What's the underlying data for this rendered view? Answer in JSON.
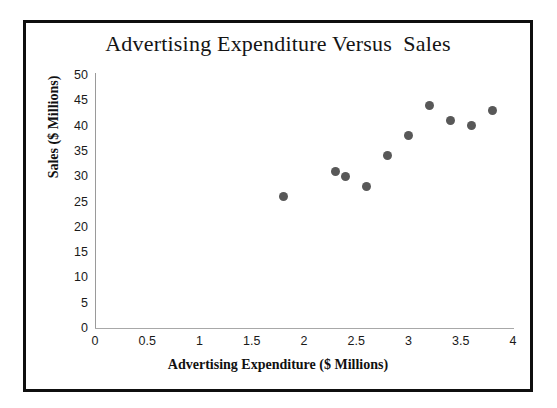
{
  "chart_data": {
    "type": "scatter",
    "title": "Advertising Expenditure Versus  Sales",
    "xlabel": "Advertising Expenditure ($ Millions)",
    "ylabel": "Sales ($ Millions)",
    "xlim": [
      0,
      4
    ],
    "ylim": [
      0,
      50
    ],
    "xticks": [
      "0",
      "0.5",
      "1",
      "1.5",
      "2",
      "2.5",
      "3",
      "3.5",
      "4"
    ],
    "xtick_values": [
      0,
      0.5,
      1,
      1.5,
      2,
      2.5,
      3,
      3.5,
      4
    ],
    "yticks": [
      "0",
      "5",
      "10",
      "15",
      "20",
      "25",
      "30",
      "35",
      "40",
      "45",
      "50"
    ],
    "ytick_values": [
      0,
      5,
      10,
      15,
      20,
      25,
      30,
      35,
      40,
      45,
      50
    ],
    "grid": false,
    "legend": false,
    "marker_color": "#585858",
    "series": [
      {
        "name": "Advertising vs Sales",
        "points": [
          {
            "x": 1.8,
            "y": 26
          },
          {
            "x": 2.3,
            "y": 31
          },
          {
            "x": 2.4,
            "y": 30
          },
          {
            "x": 2.6,
            "y": 28
          },
          {
            "x": 2.8,
            "y": 34
          },
          {
            "x": 3.0,
            "y": 38
          },
          {
            "x": 3.2,
            "y": 44
          },
          {
            "x": 3.4,
            "y": 41
          },
          {
            "x": 3.6,
            "y": 40
          },
          {
            "x": 3.8,
            "y": 43
          }
        ]
      }
    ]
  },
  "colors": {
    "frame": "#0f0f0f",
    "marker": "#585858",
    "axis": "#9a9a9a",
    "background": "#ffffff",
    "text": "#111111"
  }
}
